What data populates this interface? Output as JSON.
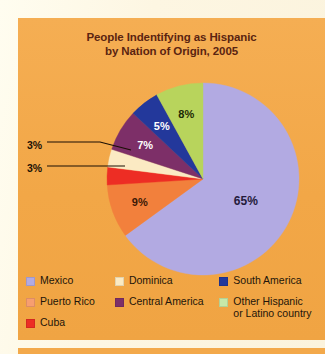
{
  "figure": {
    "background_color": "#f4ab4e",
    "page_color": "#fdf6e2",
    "title_line1": "People Indentifying as Hispanic",
    "title_line2": "by Nation of Origin, 2005",
    "title_color": "#5a2411"
  },
  "chart_data": {
    "type": "pie",
    "title": "People Indentifying as Hispanic by Nation of Origin, 2005",
    "xlabel": "",
    "ylabel": "",
    "legend_position": "bottom",
    "grid": false,
    "categories": [
      "Mexico",
      "Puerto Rico",
      "Cuba",
      "Dominica",
      "Central America",
      "South America",
      "Other  Hispanic or Latino country"
    ],
    "values": [
      65,
      9,
      3,
      3,
      7,
      5,
      8
    ],
    "value_labels": [
      "65%",
      "9%",
      "3%",
      "3%",
      "7%",
      "5%",
      "8%"
    ],
    "colors": [
      "#b2aae2",
      "#f2803c",
      "#ed2d24",
      "#fbeac3",
      "#7d2f68",
      "#23389b",
      "#b8d45c"
    ],
    "label_text_colors": [
      "#241a3c",
      "#3b1806",
      "#ffffff",
      "#1d1206",
      "#ffffff",
      "#ffffff",
      "#1d2a06"
    ],
    "start_angle_deg": 0,
    "direction": "clockwise"
  },
  "slices": [
    {
      "name": "mexico",
      "label": "65%",
      "value": 65,
      "color": "#b2aae2",
      "text_color": "#241a3c",
      "inside": true
    },
    {
      "name": "puerto-rico",
      "label": "9%",
      "value": 9,
      "color": "#f2803c",
      "text_color": "#3b1806",
      "inside": true
    },
    {
      "name": "cuba",
      "label": "3%",
      "value": 3,
      "color": "#ed2d24",
      "text_color": "#1d1206",
      "inside": false
    },
    {
      "name": "dominica",
      "label": "3%",
      "value": 3,
      "color": "#fbeac3",
      "text_color": "#1d1206",
      "inside": false
    },
    {
      "name": "central-america",
      "label": "7%",
      "value": 7,
      "color": "#7d2f68",
      "text_color": "#ffffff",
      "inside": true
    },
    {
      "name": "south-america",
      "label": "5%",
      "value": 5,
      "color": "#23389b",
      "text_color": "#ffffff",
      "inside": true
    },
    {
      "name": "other",
      "label": "8%",
      "value": 8,
      "color": "#b8d45c",
      "text_color": "#1d2a06",
      "inside": true
    }
  ],
  "callouts": {
    "dominica_label": "3%",
    "cuba_label": "3%"
  },
  "legend": {
    "columns": [
      {
        "items": [
          {
            "label": "Mexico",
            "color": "#b2aae2"
          },
          {
            "label": "Puerto Rico",
            "color": "#f79e70"
          },
          {
            "label": "Cuba",
            "color": "#ed2d24"
          }
        ]
      },
      {
        "items": [
          {
            "label": "Dominica",
            "color": "#fbeac3"
          },
          {
            "label": "Central America",
            "color": "#7d2f68"
          }
        ]
      },
      {
        "items": [
          {
            "label": "South America",
            "color": "#23389b"
          },
          {
            "label": "Other  Hispanic\nor Latino country",
            "color": "#c7e8a8"
          }
        ]
      }
    ]
  }
}
